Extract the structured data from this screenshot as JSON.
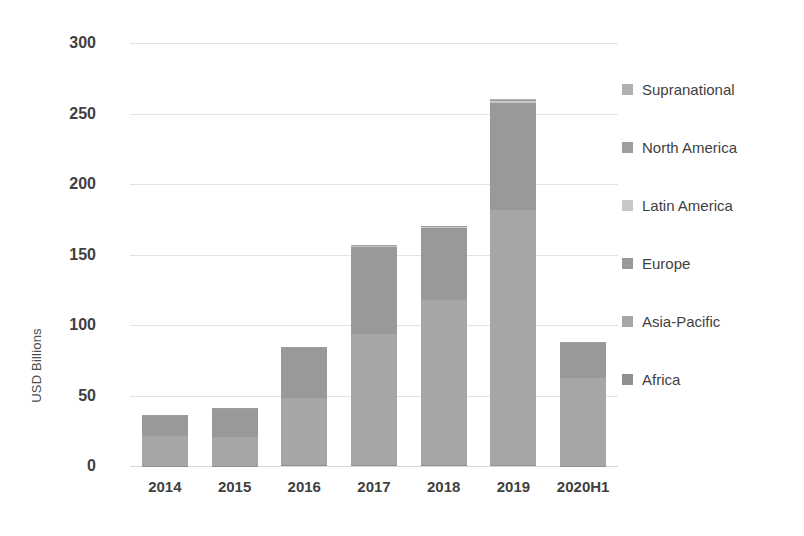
{
  "chart_data": {
    "type": "bar",
    "stacked": true,
    "title": "",
    "subtitle": "",
    "xlabel": "",
    "ylabel": "USD Billions",
    "ylim": [
      0,
      300
    ],
    "ytick_step": 50,
    "grid": true,
    "legend_position": "right",
    "categories": [
      "2014",
      "2015",
      "2016",
      "2017",
      "2018",
      "2019",
      "2020H1"
    ],
    "ytick_labels": [
      "300",
      "250",
      "200",
      "150",
      "100",
      "50",
      "0"
    ],
    "ytick_values": [
      300,
      250,
      200,
      150,
      100,
      50,
      0
    ],
    "series": [
      {
        "name": "Africa",
        "color": "#8f8f8f",
        "values": [
          0.3,
          0.3,
          0.4,
          0.5,
          0.6,
          0.8,
          0.3
        ]
      },
      {
        "name": "Asia-Pacific",
        "color": "#a6a6a6",
        "values": [
          21.0,
          20.0,
          48.0,
          93.0,
          117.0,
          181.0,
          62.0
        ]
      },
      {
        "name": "Europe",
        "color": "#999999",
        "values": [
          14.0,
          20.0,
          35.0,
          62.0,
          51.0,
          76.0,
          25.0
        ]
      },
      {
        "name": "Latin America",
        "color": "#c7c7c7",
        "values": [
          0.3,
          0.3,
          0.4,
          0.6,
          0.7,
          0.9,
          0.3
        ]
      },
      {
        "name": "North America",
        "color": "#9e9e9e",
        "values": [
          0.3,
          0.3,
          0.4,
          0.5,
          0.6,
          0.8,
          0.3
        ]
      },
      {
        "name": "Supranational",
        "color": "#b0b0b0",
        "values": [
          0.3,
          0.3,
          0.4,
          0.5,
          0.6,
          0.8,
          0.3
        ]
      }
    ],
    "totals": [
      36.2,
      41.2,
      84.6,
      157.1,
      170.5,
      260.3,
      88.2
    ]
  },
  "legend": {
    "items": [
      {
        "label": "Supranational",
        "color": "#b0b0b0"
      },
      {
        "label": "North America",
        "color": "#9e9e9e"
      },
      {
        "label": "Latin America",
        "color": "#c7c7c7"
      },
      {
        "label": "Europe",
        "color": "#999999"
      },
      {
        "label": "Asia-Pacific",
        "color": "#a6a6a6"
      },
      {
        "label": "Africa",
        "color": "#8f8f8f"
      }
    ]
  },
  "colors": {
    "gridline": "#e2e2e2",
    "text": "#3f3f3f",
    "background": "#ffffff"
  }
}
